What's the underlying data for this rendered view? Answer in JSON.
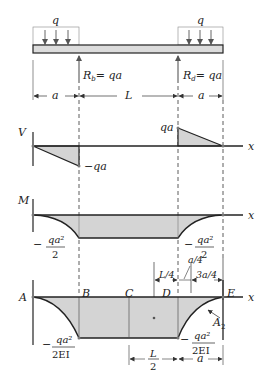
{
  "figure": {
    "loads": {
      "left_q": "q",
      "right_q": "q"
    },
    "reactions": {
      "Rb_sym": "R",
      "Rb_sub": "b",
      "Rb_val": "= qa",
      "Rd_sym": "R",
      "Rd_sub": "d",
      "Rd_val": "= qa"
    },
    "dimensions": {
      "left_a": "a",
      "span_L": "L",
      "right_a": "a",
      "L4": "L/4",
      "a4": "a/4",
      "three_a4": "3a/4",
      "L2_num": "L",
      "L2_den": "2",
      "bottom_a": "a"
    },
    "shear": {
      "axis_label": "V",
      "x_label": "x",
      "neg_label": "−qa",
      "pos_label": "qa"
    },
    "moment": {
      "axis_label": "M",
      "x_label": "x",
      "left_sign": "−",
      "left_num": "qa²",
      "left_den": "2",
      "right_sign": "−",
      "right_num": "qa²",
      "right_den": "2"
    },
    "curvature": {
      "x_label": "x",
      "point_A": "A",
      "point_B": "B",
      "point_C": "C",
      "point_D": "D",
      "point_E": "E",
      "area_label": "A",
      "area_sub": "2",
      "left_sign": "−",
      "left_num": "qa²",
      "left_den": "2EI",
      "right_sign": "−",
      "right_num": "qa²",
      "right_den": "2EI"
    },
    "colors": {
      "fill": "#d4d4d4",
      "beam_fill": "#dcdcdc",
      "line": "#222222",
      "arrow": "#666666"
    }
  }
}
